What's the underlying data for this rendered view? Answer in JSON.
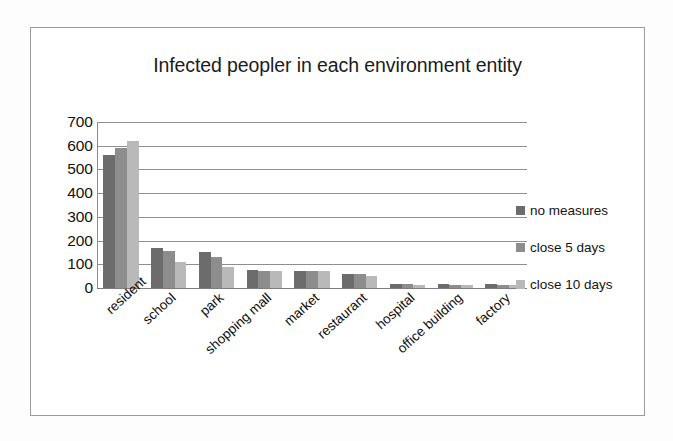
{
  "chart_data": {
    "type": "bar",
    "title": "Infected peopler in each environment entity",
    "xlabel": "",
    "ylabel": "",
    "ylim": [
      0,
      700
    ],
    "yticks": [
      700,
      600,
      500,
      400,
      300,
      200,
      100,
      0
    ],
    "grid": true,
    "legend_position": "right",
    "categories": [
      "resident",
      "school",
      "park",
      "shopping mall",
      "market",
      "restaurant",
      "hospital",
      "office building",
      "factory"
    ],
    "series": [
      {
        "name": "no measures",
        "color": "#6c6c6c",
        "values": [
          560,
          170,
          150,
          75,
          70,
          60,
          18,
          15,
          15
        ]
      },
      {
        "name": "close 5 days",
        "color": "#8d8d8d",
        "values": [
          590,
          155,
          130,
          72,
          70,
          58,
          16,
          14,
          14
        ]
      },
      {
        "name": "close 10 days",
        "color": "#b9b9b9",
        "values": [
          620,
          110,
          90,
          72,
          70,
          52,
          14,
          12,
          12
        ]
      }
    ]
  },
  "legend": {
    "items": [
      {
        "label": "no measures",
        "color": "#6c6c6c"
      },
      {
        "label": "close 5 days",
        "color": "#8d8d8d"
      },
      {
        "label": "close 10 days",
        "color": "#b9b9b9"
      }
    ]
  }
}
